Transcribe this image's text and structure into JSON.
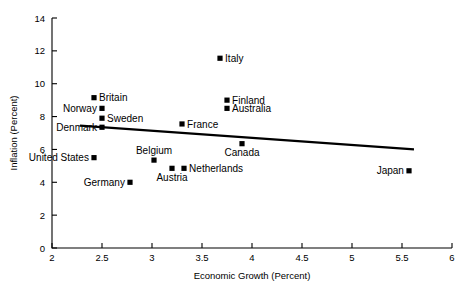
{
  "chart_data": {
    "type": "scatter",
    "title": "",
    "xlabel": "Economic Growth (Percent)",
    "ylabel": "Inflation (Percent)",
    "xlim": [
      2,
      6
    ],
    "ylim": [
      0,
      14
    ],
    "xticks": [
      "2",
      "2.5",
      "3",
      "3.5",
      "4",
      "4.5",
      "5",
      "5.5",
      "6"
    ],
    "xtick_values": [
      2,
      2.5,
      3,
      3.5,
      4,
      4.5,
      5,
      5.5,
      6
    ],
    "yticks": [
      "0",
      "2",
      "4",
      "6",
      "8",
      "10",
      "12",
      "14"
    ],
    "ytick_values": [
      0,
      2,
      4,
      6,
      8,
      10,
      12,
      14
    ],
    "grid": false,
    "legend": "none",
    "marker_color": "#000000",
    "trendline_color": "#000000",
    "points": [
      {
        "name": "Britain",
        "x": 2.42,
        "y": 9.15,
        "label_pos": "right"
      },
      {
        "name": "Norway",
        "x": 2.5,
        "y": 8.5,
        "label_pos": "left"
      },
      {
        "name": "Sweden",
        "x": 2.5,
        "y": 7.9,
        "label_pos": "right"
      },
      {
        "name": "Denmark",
        "x": 2.5,
        "y": 7.35,
        "label_pos": "left"
      },
      {
        "name": "Italy",
        "x": 3.68,
        "y": 11.55,
        "label_pos": "right"
      },
      {
        "name": "Finland",
        "x": 3.75,
        "y": 9.0,
        "label_pos": "right"
      },
      {
        "name": "Australia",
        "x": 3.75,
        "y": 8.5,
        "label_pos": "right"
      },
      {
        "name": "France",
        "x": 3.3,
        "y": 7.55,
        "label_pos": "right"
      },
      {
        "name": "Canada",
        "x": 3.9,
        "y": 6.35,
        "label_pos": "below"
      },
      {
        "name": "Belgium",
        "x": 3.02,
        "y": 5.35,
        "label_pos": "above"
      },
      {
        "name": "United States",
        "x": 2.42,
        "y": 5.5,
        "label_pos": "left"
      },
      {
        "name": "Netherlands",
        "x": 3.32,
        "y": 4.85,
        "label_pos": "right"
      },
      {
        "name": "Austria",
        "x": 3.2,
        "y": 4.85,
        "label_pos": "below"
      },
      {
        "name": "Germany",
        "x": 2.78,
        "y": 4.0,
        "label_pos": "left"
      },
      {
        "name": "Japan",
        "x": 5.57,
        "y": 4.7,
        "label_pos": "left"
      }
    ],
    "trendline": {
      "x_start": 2.28,
      "y_start": 7.45,
      "x_end": 5.62,
      "y_end": 6.0
    }
  }
}
